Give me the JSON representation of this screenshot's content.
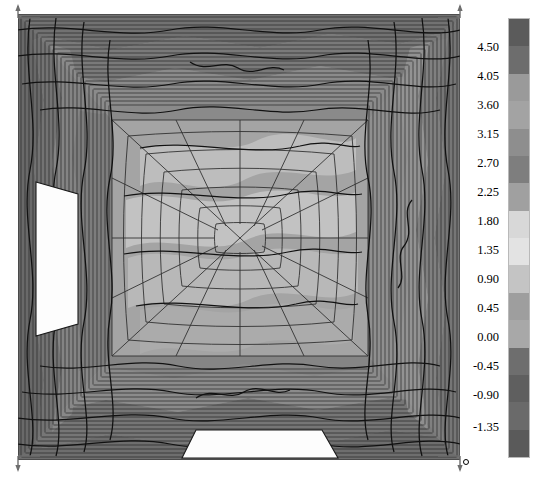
{
  "figure": {
    "kind": "3d-surface-mesh-plot",
    "background_color": "#ffffff",
    "mesh_line_color": "#1a1a1a",
    "origin_marker_label": "o"
  },
  "plot_area": {
    "left": 18,
    "top": 14,
    "right": 460,
    "bottom": 460
  },
  "axes": {
    "arrow_color": "#6e6e6e",
    "corner_arrows": [
      {
        "name": "top-left-axis-arrow",
        "x": 30,
        "y": 18
      },
      {
        "name": "top-right-axis-arrow",
        "x": 451,
        "y": 18
      },
      {
        "name": "bottom-left-axis-arrow",
        "x": 30,
        "y": 455
      },
      {
        "name": "bottom-right-axis-arrow",
        "x": 451,
        "y": 455
      }
    ]
  },
  "colorbar": {
    "name": "grayscale-contour-colorbar",
    "orientation": "vertical",
    "x": 508,
    "y": 18,
    "width": 22,
    "height": 440,
    "tick_labels": [
      "4.50",
      "4.05",
      "3.60",
      "3.15",
      "2.70",
      "2.25",
      "1.80",
      "1.35",
      "0.90",
      "0.45",
      "0.00",
      "-0.45",
      "-0.90",
      "-1.35"
    ],
    "tick_values": [
      4.5,
      4.05,
      3.6,
      3.15,
      2.7,
      2.25,
      1.8,
      1.35,
      0.9,
      0.45,
      0.0,
      -0.45,
      -0.9,
      -1.35
    ],
    "tick_y_positions": [
      47,
      76,
      105,
      134,
      163,
      192,
      221,
      250,
      279,
      308,
      337,
      366,
      395,
      427
    ],
    "band_colors": [
      "#5b5b5b",
      "#6d6d6d",
      "#9a9a9a",
      "#a3a3a3",
      "#8e8e8e",
      "#7e7e7e",
      "#a0a0a0",
      "#d8d8d8",
      "#e3e3e3",
      "#c4c4c4",
      "#9e9e9e",
      "#a8a8a8",
      "#6e6e6e",
      "#5f5f5f",
      "#6a6a6a",
      "#5a5a5a"
    ],
    "border_color": "#b9b9b9"
  },
  "chart_data": {
    "type": "heatmap",
    "title": "",
    "xlabel": "",
    "ylabel": "",
    "zlabel": "",
    "grid": false,
    "legend_position": "right",
    "colormap": "grayscale",
    "colorbar_range": [
      -1.35,
      4.5
    ],
    "colorbar_step": 0.45,
    "tick_labels": [
      "4.50",
      "4.05",
      "3.60",
      "3.15",
      "2.70",
      "2.25",
      "1.80",
      "1.35",
      "0.90",
      "0.45",
      "0.00",
      "-0.45",
      "-0.90",
      "-1.35"
    ],
    "values": [
      -1.35,
      -0.9,
      -0.45,
      0.0,
      0.45,
      0.9,
      1.35,
      1.8,
      2.25,
      2.7,
      3.15,
      3.6,
      4.05,
      4.5
    ],
    "categories": [
      "-1.35",
      "-0.90",
      "-0.45",
      "0.00",
      "0.45",
      "0.90",
      "1.35",
      "1.80",
      "2.25",
      "2.70",
      "3.15",
      "3.60",
      "4.05",
      "4.50"
    ],
    "annotations": [
      "square domain, 4 visible wall faces",
      "two unfilled (white) patches: left wall mid-height and bottom wall centre"
    ]
  }
}
